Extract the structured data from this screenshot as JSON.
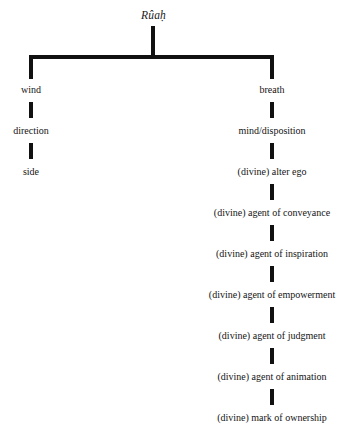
{
  "diagram": {
    "type": "tree",
    "title": "Rûaḥ",
    "root": {
      "label": "Rûaḥ",
      "italic": true
    },
    "branches": [
      {
        "name": "wind-branch",
        "side": "left",
        "nodes": [
          "wind",
          "direction",
          "side"
        ]
      },
      {
        "name": "breath-branch",
        "side": "right",
        "nodes": [
          "breath",
          "mind/disposition",
          "(divine) alter ego",
          "(divine) agent of conveyance",
          "(divine) agent of inspiration",
          "(divine) agent of empowerment",
          "(divine) agent of judgment",
          "(divine) agent of animation",
          "(divine) mark of ownership"
        ]
      }
    ],
    "colors": {
      "background": "#ffffff",
      "line": "#111111",
      "text": "#141414"
    }
  }
}
